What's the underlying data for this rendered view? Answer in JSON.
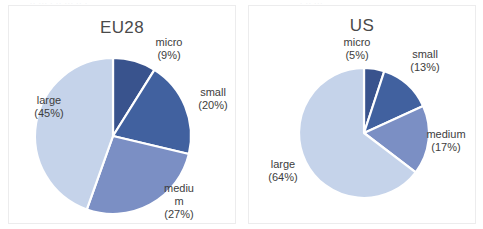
{
  "figure": {
    "background": "#ffffff",
    "top_artifact_left": "·· ···  · ··  ··· ·· ·",
    "top_artifact_right": "· ·· ···"
  },
  "palette": {
    "micro": "#39538d",
    "small": "#41619f",
    "medium": "#7b8fc4",
    "large": "#c5d3ea",
    "slice_border": "#ffffff",
    "panel_border": "#ececed",
    "text": "#3d3d3d"
  },
  "chart_data": [
    {
      "type": "pie",
      "title": "EU28",
      "categories": [
        "micro",
        "small",
        "medium",
        "large"
      ],
      "values": [
        9,
        20,
        27,
        45
      ],
      "value_unit": "%",
      "labels": [
        {
          "name": "micro",
          "text": "micro\n(9%)",
          "percent": 9
        },
        {
          "name": "small",
          "text": "small\n(20%)",
          "percent": 20
        },
        {
          "name": "medium",
          "text": "mediu\nm\n(27%)",
          "percent": 27
        },
        {
          "name": "large",
          "text": "large\n(45%)",
          "percent": 45
        }
      ],
      "legend": "none",
      "grid": false
    },
    {
      "type": "pie",
      "title": "US",
      "categories": [
        "micro",
        "small",
        "medium",
        "large"
      ],
      "values": [
        5,
        13,
        17,
        64
      ],
      "value_unit": "%",
      "labels": [
        {
          "name": "micro",
          "text": "micro\n(5%)",
          "percent": 5
        },
        {
          "name": "small",
          "text": "small\n(13%)",
          "percent": 13
        },
        {
          "name": "medium",
          "text": "medium\n(17%)",
          "percent": 17
        },
        {
          "name": "large",
          "text": "large\n(64%)",
          "percent": 64
        }
      ],
      "legend": "none",
      "grid": false
    }
  ]
}
